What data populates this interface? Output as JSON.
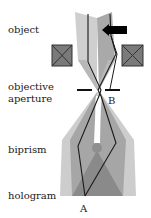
{
  "diagram": {
    "labels": {
      "object": "object",
      "objective_aperture_line1": "objective",
      "objective_aperture_line2": "aperture",
      "biprism": "biprism",
      "hologram": "hologram"
    },
    "points": {
      "A": "A",
      "B": "B"
    },
    "colors": {
      "beam_light": "#c8c8c8",
      "beam_mid": "#a8a8a8",
      "beam_dark": "#8c8c8c",
      "lens_fill": "#7a7a7a",
      "line": "#1a1a1a",
      "arrow": "#000000",
      "background": "#ffffff"
    },
    "elements": [
      {
        "name": "object-arrow",
        "description": "black arrow pointing left at object plane"
      },
      {
        "name": "lens-left",
        "description": "objective lens cross-section left"
      },
      {
        "name": "lens-right",
        "description": "objective lens cross-section right"
      },
      {
        "name": "objective-aperture",
        "description": "two horizontal bars at crossover"
      },
      {
        "name": "biprism-wire",
        "description": "circular biprism filament"
      },
      {
        "name": "hologram-plane",
        "description": "overlap region forming hologram"
      }
    ]
  }
}
